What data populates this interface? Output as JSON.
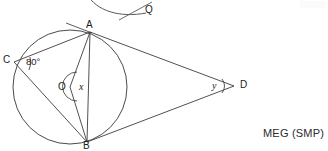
{
  "figure": {
    "type": "geometry-diagram",
    "stroke_color": "#3d3d3d",
    "background_color": "#ffffff",
    "text_color": "#1c1c1c",
    "points": [
      {
        "name": "A",
        "label": "A",
        "x": 90,
        "y": 32,
        "on_circle": true
      },
      {
        "name": "C",
        "label": "C",
        "x": 14,
        "y": 62,
        "on_circle": true
      },
      {
        "name": "B",
        "label": "B",
        "x": 87,
        "y": 142,
        "on_circle": true
      },
      {
        "name": "O",
        "label": "O",
        "x": 70,
        "y": 87,
        "on_circle": false
      },
      {
        "name": "D",
        "label": "D",
        "x": 232,
        "y": 86,
        "on_circle": false
      },
      {
        "name": "Q",
        "label": "Q",
        "x": 148,
        "y": 12,
        "on_circle": false
      }
    ],
    "circle": {
      "cx": 70,
      "cy": 87,
      "r": 57
    },
    "segments": [
      {
        "from": "C",
        "to": "A"
      },
      {
        "from": "C",
        "to": "B"
      },
      {
        "from": "A",
        "to": "B"
      },
      {
        "from": "O",
        "to": "A"
      },
      {
        "from": "O",
        "to": "B"
      },
      {
        "from": "A",
        "to": "D"
      },
      {
        "from": "B",
        "to": "D"
      }
    ],
    "angles": [
      {
        "at": "C",
        "label": "80°",
        "value": "80",
        "unit": "degrees"
      },
      {
        "at": "O",
        "label": "x",
        "value": "x",
        "unit": "unknown"
      },
      {
        "at": "D",
        "label": "y",
        "value": "y",
        "unit": "unknown"
      }
    ],
    "partial_figure_above": {
      "label": "Q",
      "description": "clipped arc and line from the figure above"
    }
  },
  "attribution": {
    "text": "MEG (SMP)"
  }
}
